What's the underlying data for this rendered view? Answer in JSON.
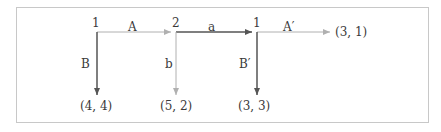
{
  "diagram": {
    "type": "game-tree",
    "nodes": [
      {
        "id": "n1",
        "label": "1"
      },
      {
        "id": "n2",
        "label": "2"
      },
      {
        "id": "n3",
        "label": "1"
      }
    ],
    "edges": [
      {
        "from": "n1",
        "to": "n2",
        "label": "A",
        "color": "#b0b0b0"
      },
      {
        "from": "n1",
        "to": "t1",
        "label": "B",
        "color": "#555555"
      },
      {
        "from": "n2",
        "to": "n3",
        "label": "a",
        "color": "#555555"
      },
      {
        "from": "n2",
        "to": "t2",
        "label": "b",
        "color": "#b0b0b0"
      },
      {
        "from": "n3",
        "to": "t4",
        "label": "A′",
        "color": "#b0b0b0"
      },
      {
        "from": "n3",
        "to": "t3",
        "label": "B′",
        "color": "#555555"
      }
    ],
    "payoffs": [
      {
        "id": "t1",
        "label": "(4,  4)"
      },
      {
        "id": "t2",
        "label": "(5,  2)"
      },
      {
        "id": "t3",
        "label": "(3,  3)"
      },
      {
        "id": "t4",
        "label": "(3,  1)"
      }
    ],
    "colors": {
      "dark_edge": "#555555",
      "light_edge": "#b0b0b0",
      "border": "#c8c8c8"
    }
  }
}
